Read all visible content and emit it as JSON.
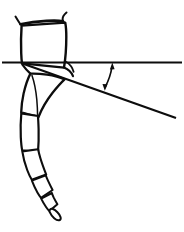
{
  "figure": {
    "background_color": "#ffffff",
    "ink_color": "#0d0d0d",
    "width": 184,
    "height": 232,
    "caption": ""
  },
  "parts": {
    "femur_label": "femur",
    "tibia_label": "tibia",
    "tarsus_label": "tarsus",
    "pretarsus_label": "pretarsus-claw",
    "coxa_spines_label": "apical spines"
  },
  "measurement": {
    "name": "angle",
    "symbol": "",
    "value": "",
    "reference_line_label": "horizontal reference line",
    "measured_line_label": "leg axis line",
    "arrow_label": "angle-arc-arrow",
    "arrow_style": "double-headed curved arrow"
  },
  "geometry": {
    "reference_line": {
      "x1": 2,
      "y1": 62.5,
      "x2": 182,
      "y2": 62.5
    },
    "measured_line": {
      "x1": 21,
      "y1": 63,
      "x2": 176,
      "y2": 118
    },
    "vertex": {
      "x": 21,
      "y": 63
    },
    "arrow": {
      "x1": 112,
      "y1": 65,
      "x2": 105,
      "y2": 89
    }
  }
}
